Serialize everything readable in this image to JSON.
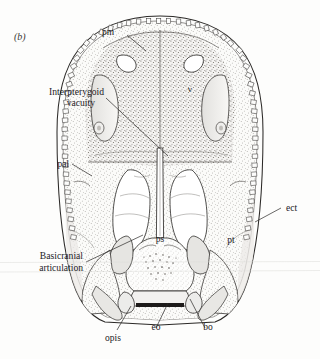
{
  "figure": {
    "panel_label": "(b)",
    "background_color": "#fdfdfc",
    "ink_color": "#2b2927"
  },
  "labels": {
    "pm": "pm",
    "interpterygoid_line1": "Interpterygoid",
    "interpterygoid_line2": "vacuity",
    "pal": "pal",
    "v": "v",
    "ect": "ect",
    "ps": "ps",
    "pt": "pt",
    "basicranial_line1": "Basicranial",
    "basicranial_line2": "articulation",
    "opis": "opis",
    "eo": "eo",
    "bo": "bo"
  },
  "label_meanings": {
    "pm": "premaxilla",
    "pal": "palatine",
    "v": "vomer",
    "ect": "ectopterygoid",
    "ps": "parasphenoid",
    "pt": "pterygoid",
    "opis": "opisthotic",
    "eo": "exoccipital",
    "bo": "basioccipital"
  }
}
